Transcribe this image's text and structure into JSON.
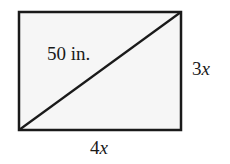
{
  "diagram": {
    "type": "rectangle-with-diagonal",
    "rectangle": {
      "x": 19,
      "y": 12,
      "width": 162,
      "height": 118,
      "fill": "#f6f6f6",
      "stroke": "#1a1a1a",
      "stroke_width": 2.5
    },
    "diagonal": {
      "from": [
        19,
        130
      ],
      "to": [
        181,
        12
      ],
      "stroke": "#1a1a1a",
      "stroke_width": 2.2
    },
    "labels": {
      "diagonal": "50 in.",
      "height_coef": "3",
      "height_var": "x",
      "width_coef": "4",
      "width_var": "x"
    }
  }
}
